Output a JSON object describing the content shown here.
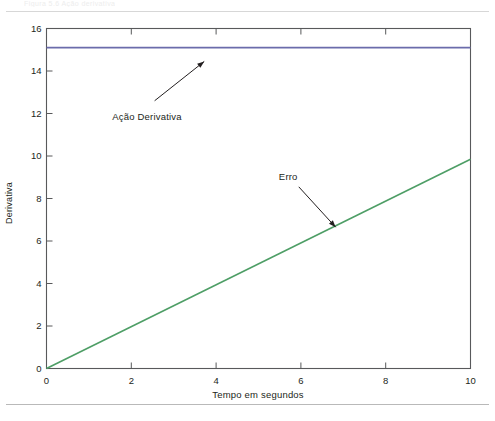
{
  "page": {
    "faint_caption": "Figura 5.6  Ação derivativa",
    "background": "#ffffff",
    "rule_color": "#d7d7d7"
  },
  "chart_data": {
    "type": "line",
    "title": "",
    "xlabel": "Tempo em segundos",
    "ylabel": "Derivativa",
    "xlim": [
      0,
      10
    ],
    "ylim": [
      0,
      16
    ],
    "xticks": [
      0,
      2,
      4,
      6,
      8,
      10
    ],
    "yticks": [
      0,
      2,
      4,
      6,
      8,
      10,
      12,
      14,
      16
    ],
    "xtick_labels": [
      "0",
      "2",
      "4",
      "6",
      "8",
      "10"
    ],
    "ytick_labels": [
      "0",
      "2",
      "4",
      "6",
      "8",
      "10",
      "12",
      "14",
      "16"
    ],
    "grid": false,
    "legend": null,
    "frame": true,
    "series": [
      {
        "name": "Ação Derivativa",
        "color": "#6b6cab",
        "linewidth": 1.6,
        "x": [
          0,
          10
        ],
        "values": [
          15.1,
          15.1
        ]
      },
      {
        "name": "Erro",
        "color": "#4e9e66",
        "linewidth": 1.6,
        "x": [
          0,
          10
        ],
        "values": [
          0,
          9.85
        ]
      }
    ],
    "annotations": [
      {
        "text": "Ação Derivativa",
        "text_x": 1.55,
        "text_y": 11.85,
        "arrow_from_x": 2.55,
        "arrow_from_y": 12.6,
        "arrow_to_x": 3.72,
        "arrow_to_y": 14.45
      },
      {
        "text": "Erro",
        "text_x": 5.48,
        "text_y": 9.0,
        "arrow_from_x": 5.95,
        "arrow_from_y": 8.55,
        "arrow_to_x": 6.82,
        "arrow_to_y": 6.65
      }
    ]
  },
  "colors": {
    "axis": "#58595b",
    "text": "#231f20",
    "derivative_line": "#6b6cab",
    "error_line": "#4e9e66"
  }
}
